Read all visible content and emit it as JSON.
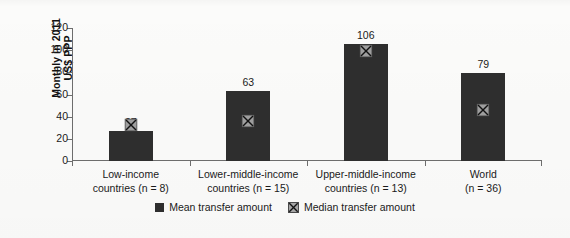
{
  "chart_data": {
    "type": "bar",
    "title": "",
    "subtitle": "",
    "xlabel": "",
    "ylabel": "Monthly in 2011 US$ PPP",
    "ylim": [
      0,
      120
    ],
    "yticks": [
      0,
      20,
      40,
      60,
      80,
      100,
      120
    ],
    "grid": false,
    "legend_position": "bottom-center",
    "categories": [
      "Low-income countries (n = 8)",
      "Lower-middle-income countries (n = 15)",
      "Upper-middle-income countries (n = 13)",
      "World (n = 36)"
    ],
    "category_lines": [
      [
        "Low-income",
        "countries (n = 8)"
      ],
      [
        "Lower-middle-income",
        "countries (n = 15)"
      ],
      [
        "Upper-middle-income",
        "countries (n = 13)"
      ],
      [
        "World",
        "(n = 36)"
      ]
    ],
    "series": [
      {
        "name": "Mean transfer amount",
        "marker": "bar",
        "color": "#2e2e2e",
        "values": [
          27,
          63,
          106,
          79
        ],
        "data_labels": [
          "27",
          "63",
          "106",
          "79"
        ]
      },
      {
        "name": "Median transfer amount",
        "marker": "x-in-square",
        "color": "#9e9e9e",
        "values": [
          33,
          37,
          100,
          47
        ],
        "data_labels": [
          "",
          "",
          "",
          ""
        ]
      }
    ]
  },
  "axis": {
    "y_title": "Monthly in 2011 US$ PPP",
    "y_title_line1": "Monthly in 2011",
    "y_title_line2": "US$ PPP",
    "tick_labels": [
      "120",
      "100",
      "80",
      "60",
      "40",
      "20",
      "0"
    ]
  },
  "legend": {
    "items": [
      {
        "label": "Mean transfer amount",
        "icon": "filled-square-icon"
      },
      {
        "label": "Median transfer amount",
        "icon": "x-marker-icon"
      }
    ]
  },
  "colors": {
    "bar": "#2e2e2e",
    "marker_fill": "#a6a6a6",
    "marker_stroke": "#1a1a1a",
    "axis": "#6d6d6d",
    "text": "#1a1a1a",
    "background": "#fbfbfa"
  }
}
